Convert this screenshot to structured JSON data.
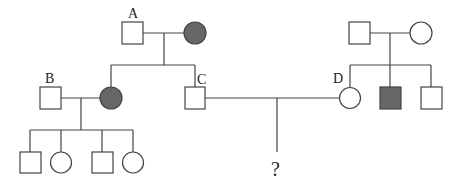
{
  "diagram": {
    "type": "pedigree",
    "colors": {
      "affected": "#676767",
      "unaffected": "#ffffff",
      "stroke": "#444444"
    },
    "individuals": [
      {
        "id": "A",
        "label": "A",
        "sex": "male",
        "affected": false,
        "generation": 1
      },
      {
        "id": "A_wife",
        "label": "",
        "sex": "female",
        "affected": true,
        "generation": 1
      },
      {
        "id": "R_f",
        "label": "",
        "sex": "male",
        "affected": false,
        "generation": 1
      },
      {
        "id": "R_m",
        "label": "",
        "sex": "female",
        "affected": false,
        "generation": 1
      },
      {
        "id": "B",
        "label": "B",
        "sex": "male",
        "affected": false,
        "generation": 2
      },
      {
        "id": "B_wife",
        "label": "",
        "sex": "female",
        "affected": true,
        "generation": 2
      },
      {
        "id": "C",
        "label": "C",
        "sex": "male",
        "affected": false,
        "generation": 2
      },
      {
        "id": "D",
        "label": "D",
        "sex": "female",
        "affected": false,
        "generation": 2
      },
      {
        "id": "D_bro1",
        "label": "",
        "sex": "male",
        "affected": true,
        "generation": 2
      },
      {
        "id": "D_bro2",
        "label": "",
        "sex": "male",
        "affected": false,
        "generation": 2
      },
      {
        "id": "g3_1",
        "label": "",
        "sex": "male",
        "affected": false,
        "generation": 3
      },
      {
        "id": "g3_2",
        "label": "",
        "sex": "female",
        "affected": false,
        "generation": 3
      },
      {
        "id": "g3_3",
        "label": "",
        "sex": "male",
        "affected": false,
        "generation": 3
      },
      {
        "id": "g3_4",
        "label": "",
        "sex": "female",
        "affected": false,
        "generation": 3
      }
    ],
    "labels": {
      "A": "A",
      "B": "B",
      "C": "C",
      "D": "D",
      "unknown": "?"
    }
  }
}
